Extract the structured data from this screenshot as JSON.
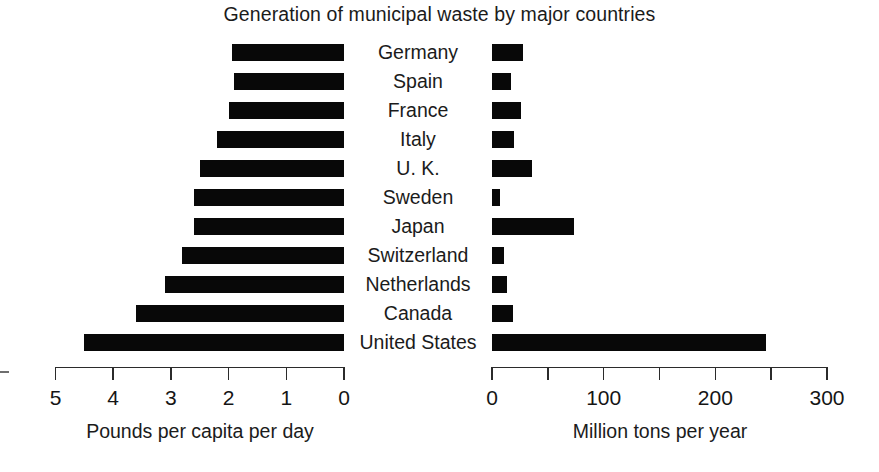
{
  "chart_data": {
    "type": "bar",
    "title": "Generation of municipal waste by major countries",
    "orientation": "horizontal",
    "layout": "bidirectional-paired-panels",
    "categories": [
      "Germany",
      "Spain",
      "France",
      "Italy",
      "U. K.",
      "Sweden",
      "Japan",
      "Switzerland",
      "Netherlands",
      "Canada",
      "United States"
    ],
    "series": [
      {
        "name": "Pounds per capita per day",
        "panel": "left",
        "direction": "right-to-left",
        "axis_label": "Pounds per capita per day",
        "xlabel": "Pounds per capita per day",
        "ylabel": "",
        "xlim": [
          5,
          0
        ],
        "axis_reversed": true,
        "ticks": [
          5,
          4,
          3,
          2,
          1,
          0
        ],
        "tick_labels": [
          "5",
          "4",
          "3",
          "2",
          "1",
          "0"
        ],
        "grid": false,
        "values": [
          1.95,
          1.9,
          2.0,
          2.2,
          2.5,
          2.6,
          2.6,
          2.8,
          3.1,
          3.6,
          4.5
        ]
      },
      {
        "name": "Million tons per year",
        "panel": "right",
        "direction": "left-to-right",
        "axis_label": "Million tons per year",
        "xlabel": "Million tons per year",
        "ylabel": "",
        "xlim": [
          0,
          300
        ],
        "axis_reversed": false,
        "ticks": [
          0,
          50,
          100,
          150,
          200,
          250,
          300
        ],
        "tick_labels": [
          "0",
          "",
          "100",
          "",
          "200",
          "",
          "300"
        ],
        "labeled_ticks": [
          0,
          100,
          200,
          300
        ],
        "grid": false,
        "values": [
          28,
          17,
          26,
          20,
          36,
          7,
          73,
          11,
          13,
          19,
          245
        ]
      }
    ],
    "legend": null,
    "legend_position": "none",
    "bar_color": "#080808",
    "background_color": "#ffffff",
    "annotations": []
  },
  "axes": {
    "left": {
      "caption": "Pounds per capita per day",
      "tick_labels": [
        "5",
        "4",
        "3",
        "2",
        "1",
        "0"
      ]
    },
    "right": {
      "caption": "Million tons per year",
      "tick_labels": [
        "0",
        "100",
        "200",
        "300"
      ]
    }
  }
}
